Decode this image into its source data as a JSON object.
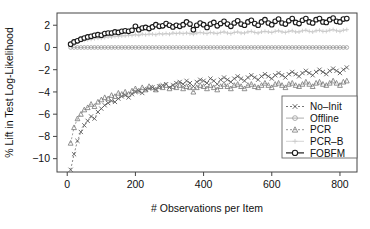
{
  "chart_data": {
    "type": "scatter",
    "title": "",
    "xlabel": "# Observations per Item",
    "ylabel": "% Lift in Test Log-Likelihood",
    "xlim": [
      -30,
      850
    ],
    "ylim": [
      -11.2,
      3.1
    ],
    "xticks": [
      0,
      200,
      400,
      600,
      800
    ],
    "yticks": [
      2,
      0,
      -2,
      -4,
      -6,
      -8,
      -10
    ],
    "grid": false,
    "legend_position": "bottom-right",
    "series": [
      {
        "name": "No-Init",
        "marker": "x",
        "line": "dashed",
        "color": "#555555",
        "x": [
          10,
          20,
          30,
          40,
          50,
          60,
          70,
          80,
          90,
          100,
          110,
          120,
          130,
          140,
          150,
          160,
          170,
          180,
          190,
          200,
          210,
          220,
          230,
          240,
          250,
          260,
          270,
          280,
          290,
          300,
          310,
          320,
          330,
          340,
          350,
          360,
          370,
          380,
          390,
          400,
          410,
          420,
          430,
          440,
          450,
          460,
          470,
          480,
          490,
          500,
          510,
          520,
          530,
          540,
          550,
          560,
          570,
          580,
          590,
          600,
          610,
          620,
          630,
          640,
          650,
          660,
          670,
          680,
          690,
          700,
          710,
          720,
          730,
          740,
          750,
          760,
          770,
          780,
          790,
          800,
          810,
          820
        ],
        "y": [
          -11.0,
          -9.6,
          -8.4,
          -7.6,
          -7.0,
          -6.6,
          -6.2,
          -6.4,
          -5.8,
          -5.5,
          -5.2,
          -5.0,
          -4.8,
          -4.9,
          -4.6,
          -4.4,
          -4.3,
          -4.5,
          -4.2,
          -4.0,
          -3.9,
          -4.1,
          -3.8,
          -3.7,
          -3.6,
          -3.8,
          -3.5,
          -3.4,
          -3.3,
          -3.6,
          -3.4,
          -3.2,
          -3.1,
          -3.3,
          -3.0,
          -3.2,
          -3.5,
          -3.1,
          -2.9,
          -3.0,
          -3.2,
          -2.8,
          -3.0,
          -3.3,
          -2.9,
          -2.7,
          -2.9,
          -3.1,
          -2.8,
          -2.6,
          -2.8,
          -3.0,
          -2.7,
          -2.5,
          -2.7,
          -2.9,
          -2.6,
          -2.4,
          -2.6,
          -2.8,
          -2.5,
          -2.3,
          -2.5,
          -2.7,
          -2.4,
          -2.2,
          -2.4,
          -2.6,
          -2.3,
          -2.1,
          -2.3,
          -2.5,
          -2.2,
          -2.0,
          -2.2,
          -2.4,
          -2.1,
          -1.9,
          -2.1,
          -2.3,
          -2.0,
          -1.8
        ]
      },
      {
        "name": "Offline",
        "marker": "circle",
        "line": "solid",
        "color": "#9a9a9a",
        "x": [
          10,
          20,
          30,
          40,
          50,
          60,
          70,
          80,
          90,
          100,
          110,
          120,
          130,
          140,
          150,
          160,
          170,
          180,
          190,
          200,
          210,
          220,
          230,
          240,
          250,
          260,
          270,
          280,
          290,
          300,
          310,
          320,
          330,
          340,
          350,
          360,
          370,
          380,
          390,
          400,
          410,
          420,
          430,
          440,
          450,
          460,
          470,
          480,
          490,
          500,
          510,
          520,
          530,
          540,
          550,
          560,
          570,
          580,
          590,
          600,
          610,
          620,
          630,
          640,
          650,
          660,
          670,
          680,
          690,
          700,
          710,
          720,
          730,
          740,
          750,
          760,
          770,
          780,
          790,
          800,
          810,
          820
        ],
        "y": [
          0,
          0,
          0,
          0,
          0,
          0,
          0,
          0,
          0,
          0,
          0,
          0,
          0,
          0,
          0,
          0,
          0,
          0,
          0,
          0,
          0,
          0,
          0,
          0,
          0,
          0,
          0,
          0,
          0,
          0,
          0,
          0,
          0,
          0,
          0,
          0,
          0,
          0,
          0,
          0,
          0,
          0,
          0,
          0,
          0,
          0,
          0,
          0,
          0,
          0,
          0,
          0,
          0,
          0,
          0,
          0,
          0,
          0,
          0,
          0,
          0,
          0,
          0,
          0,
          0,
          0,
          0,
          0,
          0,
          0,
          0,
          0,
          0,
          0,
          0,
          0,
          0,
          0,
          0,
          0,
          0,
          0
        ]
      },
      {
        "name": "PCR",
        "marker": "triangle",
        "line": "dashed",
        "color": "#777777",
        "x": [
          10,
          20,
          30,
          40,
          50,
          60,
          70,
          80,
          90,
          100,
          110,
          120,
          130,
          140,
          150,
          160,
          170,
          180,
          190,
          200,
          210,
          220,
          230,
          240,
          250,
          260,
          270,
          280,
          290,
          300,
          310,
          320,
          330,
          340,
          350,
          360,
          370,
          380,
          390,
          400,
          410,
          420,
          430,
          440,
          450,
          460,
          470,
          480,
          490,
          500,
          510,
          520,
          530,
          540,
          550,
          560,
          570,
          580,
          590,
          600,
          610,
          620,
          630,
          640,
          650,
          660,
          670,
          680,
          690,
          700,
          710,
          720,
          730,
          740,
          750,
          760,
          770,
          780,
          790,
          800,
          810,
          820
        ],
        "y": [
          -8.6,
          -7.2,
          -6.4,
          -6.0,
          -5.6,
          -5.4,
          -5.1,
          -5.3,
          -4.9,
          -4.7,
          -4.5,
          -4.6,
          -4.3,
          -4.4,
          -4.1,
          -4.2,
          -4.0,
          -4.2,
          -3.9,
          -3.7,
          -3.9,
          -3.6,
          -3.8,
          -3.5,
          -3.6,
          -3.8,
          -3.5,
          -3.6,
          -3.4,
          -3.7,
          -3.5,
          -3.6,
          -3.4,
          -3.7,
          -3.5,
          -3.6,
          -4.0,
          -3.6,
          -3.4,
          -3.5,
          -3.7,
          -3.4,
          -3.6,
          -3.8,
          -3.5,
          -3.3,
          -3.5,
          -3.7,
          -3.4,
          -3.3,
          -3.5,
          -3.7,
          -3.4,
          -3.3,
          -3.5,
          -3.6,
          -3.4,
          -3.2,
          -3.4,
          -3.6,
          -3.3,
          -3.2,
          -3.4,
          -3.6,
          -3.3,
          -3.2,
          -3.4,
          -3.5,
          -3.3,
          -3.1,
          -3.3,
          -3.5,
          -3.2,
          -3.1,
          -3.3,
          -3.4,
          -3.2,
          -3.0,
          -3.2,
          -3.4,
          -3.1,
          -3.0
        ]
      },
      {
        "name": "PCR-B",
        "marker": "plus",
        "line": "solid",
        "color": "#c9c9c9",
        "x": [
          10,
          20,
          30,
          40,
          50,
          60,
          70,
          80,
          90,
          100,
          110,
          120,
          130,
          140,
          150,
          160,
          170,
          180,
          190,
          200,
          210,
          220,
          230,
          240,
          250,
          260,
          270,
          280,
          290,
          300,
          310,
          320,
          330,
          340,
          350,
          360,
          370,
          380,
          390,
          400,
          410,
          420,
          430,
          440,
          450,
          460,
          470,
          480,
          490,
          500,
          510,
          520,
          530,
          540,
          550,
          560,
          570,
          580,
          590,
          600,
          610,
          620,
          630,
          640,
          650,
          660,
          670,
          680,
          690,
          700,
          710,
          720,
          730,
          740,
          750,
          760,
          770,
          780,
          790,
          800,
          810,
          820
        ],
        "y": [
          0.25,
          0.4,
          0.5,
          0.6,
          0.65,
          0.7,
          0.75,
          0.8,
          0.85,
          0.85,
          0.9,
          0.95,
          0.95,
          1.0,
          1.0,
          1.05,
          1.05,
          1.1,
          1.1,
          1.15,
          1.1,
          1.2,
          1.15,
          1.2,
          1.2,
          1.15,
          1.25,
          1.2,
          1.25,
          1.2,
          1.3,
          1.25,
          1.3,
          1.25,
          1.3,
          1.25,
          1.2,
          1.3,
          1.35,
          1.3,
          1.25,
          1.35,
          1.3,
          1.25,
          1.35,
          1.4,
          1.3,
          1.25,
          1.35,
          1.4,
          1.3,
          1.3,
          1.4,
          1.45,
          1.35,
          1.3,
          1.4,
          1.45,
          1.4,
          1.35,
          1.45,
          1.5,
          1.4,
          1.35,
          1.45,
          1.5,
          1.4,
          1.4,
          1.5,
          1.55,
          1.45,
          1.4,
          1.5,
          1.55,
          1.45,
          1.45,
          1.55,
          1.6,
          1.5,
          1.45,
          1.55,
          1.6
        ]
      },
      {
        "name": "FOBFM",
        "marker": "circle-filled",
        "line": "solid",
        "color": "#1a1a1a",
        "x": [
          10,
          20,
          30,
          40,
          50,
          60,
          70,
          80,
          90,
          100,
          110,
          120,
          130,
          140,
          150,
          160,
          170,
          180,
          190,
          200,
          210,
          220,
          230,
          240,
          250,
          260,
          270,
          280,
          290,
          300,
          310,
          320,
          330,
          340,
          350,
          360,
          370,
          380,
          390,
          400,
          410,
          420,
          430,
          440,
          450,
          460,
          470,
          480,
          490,
          500,
          510,
          520,
          530,
          540,
          550,
          560,
          570,
          580,
          590,
          600,
          610,
          620,
          630,
          640,
          650,
          660,
          670,
          680,
          690,
          700,
          710,
          720,
          730,
          740,
          750,
          760,
          770,
          780,
          790,
          800,
          810,
          820
        ],
        "y": [
          0.3,
          0.5,
          0.6,
          0.75,
          0.85,
          0.95,
          1.0,
          1.1,
          1.15,
          1.1,
          1.25,
          1.3,
          1.3,
          1.4,
          1.35,
          1.45,
          1.5,
          1.45,
          1.55,
          1.9,
          1.6,
          1.75,
          1.8,
          1.7,
          1.85,
          2.05,
          1.9,
          1.95,
          2.15,
          2.0,
          1.85,
          2.0,
          1.9,
          2.05,
          2.3,
          2.1,
          1.6,
          2.0,
          2.2,
          2.05,
          1.8,
          2.1,
          2.25,
          1.95,
          2.15,
          2.35,
          2.1,
          1.9,
          2.2,
          2.4,
          2.1,
          2.0,
          2.3,
          2.45,
          2.15,
          2.0,
          2.3,
          2.5,
          2.2,
          2.05,
          2.35,
          2.55,
          2.2,
          2.1,
          2.4,
          2.6,
          2.25,
          2.15,
          2.45,
          2.6,
          2.3,
          2.2,
          2.5,
          2.6,
          2.3,
          2.25,
          2.5,
          2.65,
          2.35,
          2.3,
          2.55,
          2.6
        ]
      }
    ]
  },
  "legend": {
    "entries": [
      {
        "label": "No-Init"
      },
      {
        "label": "Offline"
      },
      {
        "label": "PCR"
      },
      {
        "label": "PCR-B"
      },
      {
        "label": "FOBFM"
      }
    ]
  }
}
